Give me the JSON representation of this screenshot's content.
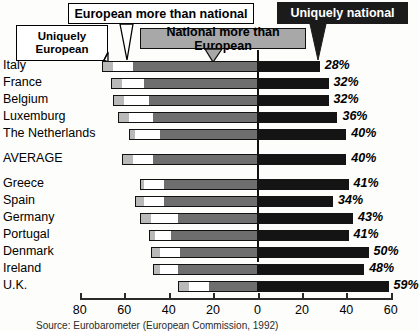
{
  "callouts": {
    "uniquely_european": "Uniquely\nEuropean",
    "european_more_than_national": "European more than national",
    "national_more_than_european": "National more than European",
    "uniquely_national": "Uniquely national"
  },
  "source": "Source: Eurobarometer (European Commission, 1992)",
  "colors": {
    "uniquely_european": "#b9b9b9",
    "european_more_than_national": "#ffffff",
    "national_more_than_european": "#6e6e6e",
    "uniquely_national": "#141414",
    "axis": "#2a2a2a",
    "zero_line": "#111111"
  },
  "chart_data": {
    "type": "bar",
    "title": "",
    "subtitle": "",
    "orientation": "horizontal",
    "stacked": true,
    "diverging": true,
    "xlabel": "",
    "ylabel": "",
    "xlim": [
      -80,
      60
    ],
    "axis_tick_labels": [
      "80",
      "60",
      "40",
      "20",
      "0",
      "20",
      "40",
      "60"
    ],
    "axis_tick_values": [
      -80,
      -60,
      -40,
      -20,
      0,
      20,
      40,
      60
    ],
    "grid": false,
    "legend_position": "top-callouts",
    "value_label_suffix": "%",
    "categories": [
      "Italy",
      "France",
      "Belgium",
      "Luxemburg",
      "The Netherlands",
      "AVERAGE",
      "Greece",
      "Spain",
      "Germany",
      "Portugal",
      "Denmark",
      "Ireland",
      "U.K."
    ],
    "series": [
      {
        "name": "Uniquely European",
        "values": [
          5,
          5,
          5,
          5,
          3,
          5,
          2,
          4,
          5,
          3,
          4,
          3,
          5
        ]
      },
      {
        "name": "European more than national",
        "values": [
          9,
          10,
          11,
          11,
          11,
          9,
          9,
          9,
          12,
          7,
          9,
          8,
          9
        ]
      },
      {
        "name": "National more than European",
        "values": [
          56,
          51,
          49,
          47,
          44,
          47,
          42,
          42,
          36,
          39,
          35,
          36,
          22
        ]
      },
      {
        "name": "Uniquely national",
        "values": [
          28,
          32,
          32,
          36,
          40,
          40,
          41,
          34,
          43,
          41,
          50,
          48,
          59
        ]
      }
    ],
    "value_labels": [
      "28%",
      "32%",
      "32%",
      "36%",
      "40%",
      "40%",
      "41%",
      "34%",
      "43%",
      "41%",
      "50%",
      "48%",
      "59%"
    ]
  },
  "layout": {
    "rows": [
      {
        "label": "Italy",
        "y": 2,
        "gap_after": false
      },
      {
        "label": "France",
        "y": 19,
        "gap_after": false
      },
      {
        "label": "Belgium",
        "y": 36,
        "gap_after": false
      },
      {
        "label": "Luxemburg",
        "y": 53,
        "gap_after": false
      },
      {
        "label": "The Netherlands",
        "y": 70,
        "gap_after": true
      },
      {
        "label": "AVERAGE",
        "y": 95,
        "gap_after": true
      },
      {
        "label": "Greece",
        "y": 120,
        "gap_after": false
      },
      {
        "label": "Spain",
        "y": 137,
        "gap_after": false
      },
      {
        "label": "Germany",
        "y": 154,
        "gap_after": false
      },
      {
        "label": "Portugal",
        "y": 171,
        "gap_after": false
      },
      {
        "label": "Denmark",
        "y": 188,
        "gap_after": false
      },
      {
        "label": "Ireland",
        "y": 205,
        "gap_after": false
      },
      {
        "label": "U.K.",
        "y": 222,
        "gap_after": false
      }
    ]
  }
}
